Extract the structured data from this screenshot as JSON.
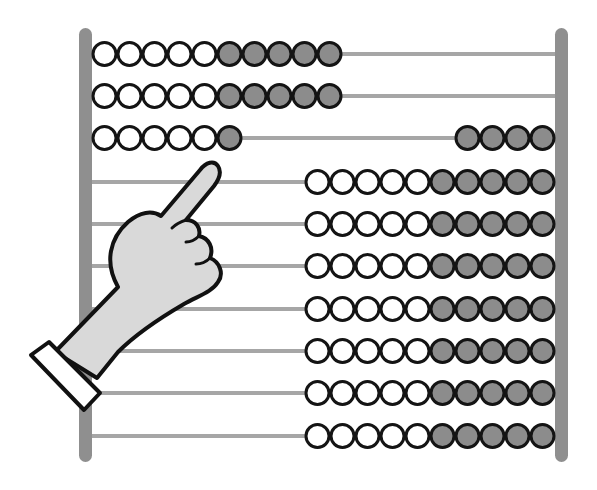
{
  "illustration": {
    "subject": "abacus with pointing hand",
    "colors": {
      "frame": "#8f8f8f",
      "rod": "#a6a6a6",
      "bead_outline": "#141414",
      "bead_white": "#ffffff",
      "bead_gray": "#8c8c8c",
      "hand_fill": "#d9d9d9",
      "hand_outline": "#111111",
      "cuff_fill": "#ffffff"
    },
    "frame": {
      "left": {
        "x": 79,
        "width": 13,
        "top": 28,
        "bottom": 462
      },
      "right": {
        "x": 555,
        "width": 13,
        "top": 28,
        "bottom": 462
      }
    },
    "bead_diameter": 25,
    "rows": [
      {
        "y": 54,
        "left_white": 5,
        "left_gray": 5,
        "right_white": 0,
        "right_gray": 0
      },
      {
        "y": 96,
        "left_white": 5,
        "left_gray": 5,
        "right_white": 0,
        "right_gray": 0
      },
      {
        "y": 138,
        "left_white": 5,
        "left_gray": 1,
        "right_white": 0,
        "right_gray": 4
      },
      {
        "y": 182,
        "left_white": 0,
        "left_gray": 0,
        "right_white": 5,
        "right_gray": 5
      },
      {
        "y": 224,
        "left_white": 0,
        "left_gray": 0,
        "right_white": 5,
        "right_gray": 5
      },
      {
        "y": 266,
        "left_white": 0,
        "left_gray": 0,
        "right_white": 5,
        "right_gray": 5
      },
      {
        "y": 309,
        "left_white": 0,
        "left_gray": 0,
        "right_white": 5,
        "right_gray": 5
      },
      {
        "y": 351,
        "left_white": 0,
        "left_gray": 0,
        "right_white": 5,
        "right_gray": 5
      },
      {
        "y": 393,
        "left_white": 0,
        "left_gray": 0,
        "right_white": 5,
        "right_gray": 5
      },
      {
        "y": 436,
        "left_white": 0,
        "left_gray": 0,
        "right_white": 5,
        "right_gray": 5
      }
    ],
    "hand": {
      "pose": "index finger pointing up-right",
      "target_row": 4
    }
  }
}
